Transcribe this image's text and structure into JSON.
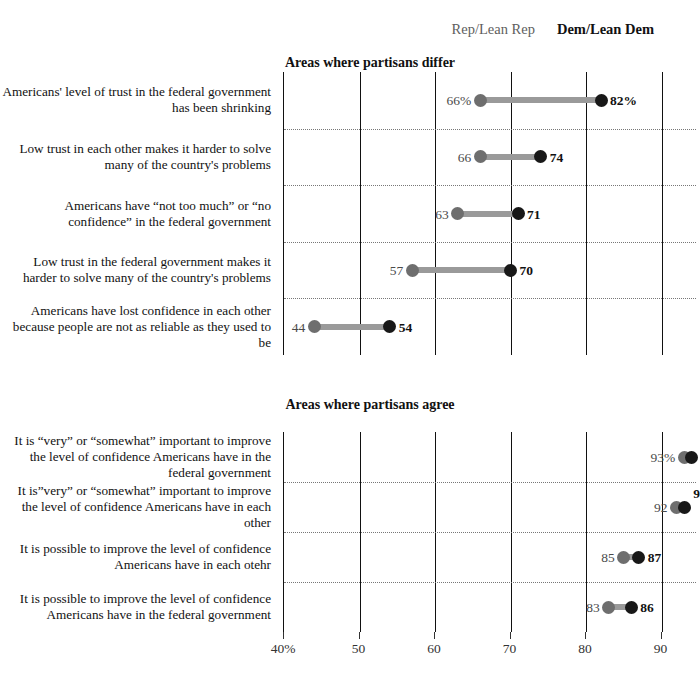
{
  "legend": {
    "rep": "Rep/Lean Rep",
    "dem": "Dem/Lean Dem",
    "rep_color": "#6e6e6e",
    "dem_color": "#181818",
    "connector_color": "#9a9a9a"
  },
  "chart_data": {
    "type": "scatter",
    "title": "",
    "xlabel": "",
    "ylabel": "",
    "xlim": [
      40,
      92
    ],
    "grid": true,
    "legend_position": "top-right",
    "xticks": [
      40,
      50,
      60,
      70,
      80,
      90
    ],
    "xtick_labels": [
      "40%",
      "50",
      "60",
      "70",
      "80",
      "90"
    ],
    "series": [
      {
        "name": "Rep/Lean Rep",
        "color": "#6e6e6e"
      },
      {
        "name": "Dem/Lean Dem",
        "color": "#181818"
      }
    ],
    "panels": [
      {
        "title": "Areas where partisans differ",
        "rows": [
          {
            "label": "Americans' level of trust in the federal government has been shrinking",
            "rep": 66,
            "dem": 82,
            "rep_label": "66%",
            "dem_label": "82%"
          },
          {
            "label": "Low trust in each other makes it harder to solve many of the country's problems",
            "rep": 66,
            "dem": 74,
            "rep_label": "66",
            "dem_label": "74"
          },
          {
            "label": "Americans have “not too much” or “no confidence” in the federal government",
            "rep": 63,
            "dem": 71,
            "rep_label": "63",
            "dem_label": "71"
          },
          {
            "label": "Low trust in the federal government makes it harder to solve many of the country's problems",
            "rep": 57,
            "dem": 70,
            "rep_label": "57",
            "dem_label": "70"
          },
          {
            "label": "Americans have lost confidence in each other because people are not as reliable as they used to be",
            "rep": 44,
            "dem": 54,
            "rep_label": "44",
            "dem_label": "54"
          }
        ]
      },
      {
        "title": "Areas where partisans agree",
        "rows": [
          {
            "label": "It is “very” or “somewhat” important to improve the level of confidence Americans have in the federal government",
            "rep": 93,
            "dem": 94,
            "rep_label": "93%",
            "dem_label": "94"
          },
          {
            "label": "It is”very” or “somewhat” important to improve the level of confidence Americans have in each other",
            "rep": 92,
            "dem": 93,
            "rep_label": "92",
            "dem_label": "93"
          },
          {
            "label": "It is possible to improve the level of confidence Americans have in each otehr",
            "rep": 85,
            "dem": 87,
            "rep_label": "85",
            "dem_label": "87"
          },
          {
            "label": "It is possible to improve the level of confidence Americans have in the federal government",
            "rep": 83,
            "dem": 86,
            "rep_label": "83",
            "dem_label": "86"
          }
        ]
      }
    ]
  }
}
